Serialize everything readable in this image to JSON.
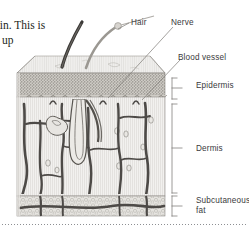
{
  "page": {
    "background_color": "#ffffff",
    "width": 249,
    "height": 231
  },
  "body_text": {
    "line1": "kin. This is",
    "line2": "e up",
    "color": "#231f20"
  },
  "figure": {
    "style": "grayscale-anatomical-illustration",
    "ink_color": "#4a4a4c",
    "labels": [
      {
        "id": "hair",
        "text": "Hair",
        "leader": "down-left"
      },
      {
        "id": "nerve",
        "text": "Nerve",
        "leader": "down-left"
      },
      {
        "id": "blood_vessel",
        "text": "Blood vessel",
        "leader": "down-left"
      },
      {
        "id": "epidermis",
        "text": "Epidermis",
        "leader": "bracket"
      },
      {
        "id": "dermis",
        "text": "Dermis",
        "leader": "bracket"
      },
      {
        "id": "subcutaneous_fat",
        "text": "Subcutaneous\nfat",
        "leader": "bracket"
      }
    ],
    "layers": [
      {
        "name": "Epidermis",
        "bracket_top": 78,
        "bracket_bottom": 99
      },
      {
        "name": "Dermis",
        "bracket_top": 104,
        "bracket_bottom": 193
      },
      {
        "name": "Subcutaneous fat",
        "bracket_top": 196,
        "bracket_bottom": 216
      }
    ],
    "label_color": "#3a3a3c"
  },
  "rule": {
    "style": "dotted",
    "color": "#8d8f93"
  }
}
